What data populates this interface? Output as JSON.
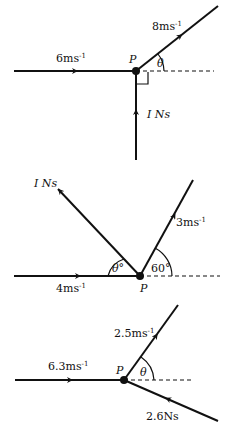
{
  "diagrams": [
    {
      "id": "diagram-1",
      "point_label": "P",
      "incoming_velocity": "6ms",
      "outgoing_velocity": "8ms",
      "impulse": "I Ns",
      "angle_label": "θ",
      "unit_exp": "-1",
      "right_angle_marker": true
    },
    {
      "id": "diagram-2",
      "point_label": "P",
      "incoming_velocity": "4ms",
      "outgoing_velocity": "3ms",
      "impulse": "I Ns",
      "angle_label": "θ°",
      "angle_outgoing": "60°",
      "unit_exp": "-1"
    },
    {
      "id": "diagram-3",
      "point_label": "P",
      "incoming_velocity": "6.3ms",
      "outgoing_velocity": "2.5ms",
      "impulse": "2.6Ns",
      "angle_label": "θ",
      "unit_exp": "-1"
    }
  ]
}
